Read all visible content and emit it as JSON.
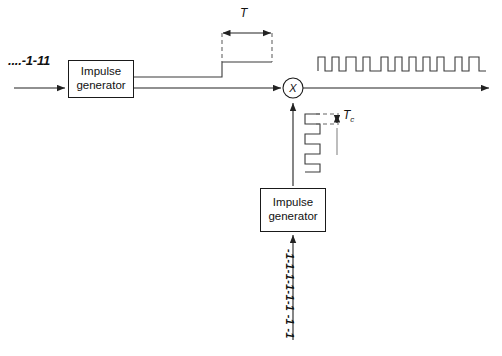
{
  "diagram": {
    "background_color": "#ffffff",
    "line_color": "#3a3a3a",
    "text_color": "#111111"
  },
  "labels": {
    "input_sequence": "....-1-11",
    "symbol_period": "T",
    "chip_period_base": "T",
    "chip_period_sub": "c",
    "code_sequence": "-1-1-1-1-1-1 -1 -1",
    "multiplier_symbol": "X"
  },
  "blocks": [
    {
      "name": "impulse-generator-data",
      "line1": "Impulse",
      "line2": "generator"
    },
    {
      "name": "impulse-generator-code",
      "line1": "Impulse",
      "line2": "generator"
    }
  ],
  "waveforms": {
    "data_pulse": {
      "description": "single rectangular data symbol of duration T",
      "rise_x": 222,
      "fall_x": 272,
      "baseline_y": 77,
      "top_y": 62
    },
    "chip_sequence_vertical": {
      "description": "vertical square wave chip train",
      "cycles": 4
    },
    "output_spread": {
      "description": "spread spectrum output square wave",
      "pulse_count": 13
    }
  }
}
